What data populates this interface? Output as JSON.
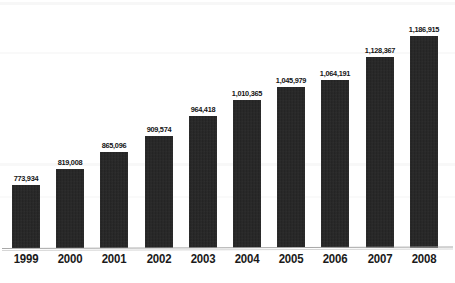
{
  "chart_data": {
    "type": "bar",
    "title": "",
    "subtitle": "",
    "xlabel": "",
    "ylabel": "",
    "categories": [
      "1999",
      "2000",
      "2001",
      "2002",
      "2003",
      "2004",
      "2005",
      "2006",
      "2007",
      "2008"
    ],
    "values": [
      773934,
      819008,
      865096,
      909574,
      964418,
      1010365,
      1045979,
      1064191,
      1128367,
      1186915
    ],
    "value_labels": [
      "773,934",
      "819,008",
      "865,096",
      "909,574",
      "964,418",
      "1,010,365",
      "1,045,979",
      "1,064,191",
      "1,128,367",
      "1,186,915"
    ],
    "series": [
      {
        "name": "",
        "values": [
          773934,
          819008,
          865096,
          909574,
          964418,
          1010365,
          1045979,
          1064191,
          1128367,
          1186915
        ]
      }
    ],
    "ylim": [
      600000,
      1230000
    ],
    "grid": false,
    "legend": false,
    "legend_position": "none",
    "bar_color": "#242424",
    "background_color": "#ffffff",
    "axis_color": "#a8a8a8",
    "label_color": "#141414",
    "bar_pixel_tops": [
      92,
      85,
      78,
      72,
      64,
      57,
      52,
      49,
      41,
      33
    ],
    "baseline_pixel": 248
  }
}
